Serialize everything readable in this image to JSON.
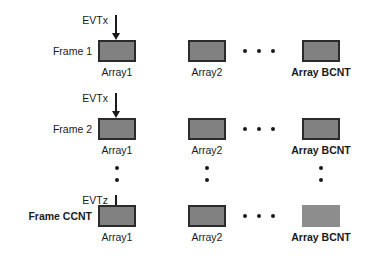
{
  "diagram": {
    "colors": {
      "box_fill": "#818181",
      "box_border": "#2b2b2b",
      "box_fill_light": "#8d8d8d",
      "ink": "#1a1a1a",
      "background": "#ffffff"
    },
    "rows": [
      {
        "frame_label": "Frame 1",
        "frame_label_bold": false,
        "event_label": "EVTx",
        "arrow_name": "evtx-arrow-frame-1",
        "arrays": [
          {
            "caption": "Array1",
            "caption_bold": false,
            "bordered": true
          },
          {
            "caption": "Array2",
            "caption_bold": false,
            "bordered": true
          },
          {
            "caption": "Array BCNT",
            "caption_bold": true,
            "bordered": true
          }
        ],
        "horizontal_ellipsis_dots": 3
      },
      {
        "frame_label": "Frame 2",
        "frame_label_bold": false,
        "event_label": "EVTx",
        "arrow_name": "evtx-arrow-frame-2",
        "arrays": [
          {
            "caption": "Array1",
            "caption_bold": false,
            "bordered": true
          },
          {
            "caption": "Array2",
            "caption_bold": false,
            "bordered": true
          },
          {
            "caption": "Array BCNT",
            "caption_bold": true,
            "bordered": true
          }
        ],
        "horizontal_ellipsis_dots": 3
      },
      {
        "frame_label": "Frame CCNT",
        "frame_label_bold": true,
        "event_label": "EVTz",
        "arrow_name": "evtz-arrow-frame-ccnt",
        "arrays": [
          {
            "caption": "Array1",
            "caption_bold": false,
            "bordered": true
          },
          {
            "caption": "Array2",
            "caption_bold": false,
            "bordered": true
          },
          {
            "caption": "Array BCNT",
            "caption_bold": true,
            "bordered": false
          }
        ],
        "horizontal_ellipsis_dots": 3
      }
    ],
    "vertical_ellipsis_columns": 3,
    "vertical_ellipsis_dots": 2
  }
}
